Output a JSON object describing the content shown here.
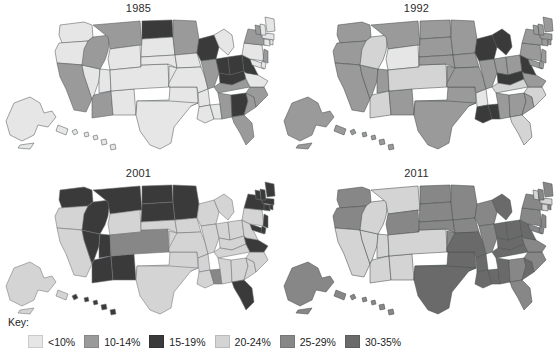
{
  "figure": {
    "title": "",
    "type": "choropleth-map-small-multiples",
    "panel_count": 4
  },
  "panels": [
    {
      "id": "p1985",
      "title": "1985",
      "position": "top-left"
    },
    {
      "id": "p1992",
      "title": "1992",
      "position": "top-right"
    },
    {
      "id": "p2001",
      "title": "2001",
      "position": "bottom-left"
    },
    {
      "id": "p2011",
      "title": "2011",
      "position": "bottom-right"
    }
  ],
  "legend": {
    "label": "Key:",
    "items": [
      {
        "range": "<10%",
        "color": "#e6e6e6"
      },
      {
        "range": "10-14%",
        "color": "#9a9a9a"
      },
      {
        "range": "15-19%",
        "color": "#3a3a3a"
      },
      {
        "range": "20-24%",
        "color": "#d4d4d4"
      },
      {
        "range": "25-29%",
        "color": "#878787"
      },
      {
        "range": "30-35%",
        "color": "#6a6a6a"
      }
    ]
  },
  "chart_data": {
    "type": "heatmap",
    "title": "",
    "subtitle": "",
    "xlabel": "",
    "ylabel": "",
    "legend_position": "bottom-left",
    "grid": false,
    "bins": [
      "<10%",
      "10-14%",
      "15-19%",
      "20-24%",
      "25-29%",
      "30-35%"
    ],
    "bin_colors": [
      "#e6e6e6",
      "#9a9a9a",
      "#3a3a3a",
      "#d4d4d4",
      "#878787",
      "#6a6a6a"
    ],
    "panels": [
      "1985",
      "1992",
      "2001",
      "2011"
    ],
    "series": [
      {
        "name": "1985",
        "values": {
          "WA": "<10%",
          "OR": "<10%",
          "CA": "10-14%",
          "NV": "<10%",
          "ID": "10-14%",
          "MT": "10-14%",
          "WY": "<10%",
          "UT": "<10%",
          "AZ": "10-14%",
          "NM": "<10%",
          "CO": "<10%",
          "ND": "15-19%",
          "SD": "<10%",
          "NE": "<10%",
          "KS": "<10%",
          "OK": "<10%",
          "TX": "<10%",
          "MN": "10-14%",
          "IA": "<10%",
          "MO": "<10%",
          "AR": "<10%",
          "LA": "<10%",
          "WI": "15-19%",
          "IL": "10-14%",
          "MS": "<10%",
          "MI": "<10%",
          "IN": "15-19%",
          "OH": "15-19%",
          "KY": "15-19%",
          "TN": "10-14%",
          "AL": "10-14%",
          "GA": "15-19%",
          "FL": "10-14%",
          "SC": "10-14%",
          "NC": "10-14%",
          "VA": "<10%",
          "WV": "15-19%",
          "MD": "<10%",
          "DE": "<10%",
          "PA": "<10%",
          "NJ": "10-14%",
          "NY": "10-14%",
          "CT": "<10%",
          "RI": "<10%",
          "MA": "<10%",
          "VT": "10-14%",
          "NH": "<10%",
          "ME": "<10%",
          "AK": "<10%",
          "HI": "<10%"
        }
      },
      {
        "name": "1992",
        "values": {
          "WA": "10-14%",
          "OR": "10-14%",
          "CA": "10-14%",
          "NV": "10-14%",
          "ID": "20-24%",
          "MT": "10-14%",
          "WY": "<10%",
          "UT": "10-14%",
          "AZ": "20-24%",
          "NM": "10-14%",
          "CO": "20-24%",
          "ND": "10-14%",
          "SD": "10-14%",
          "NE": "10-14%",
          "KS": "10-14%",
          "OK": "10-14%",
          "TX": "10-14%",
          "MN": "10-14%",
          "IA": "10-14%",
          "MO": "10-14%",
          "AR": "<10%",
          "LA": "15-19%",
          "WI": "15-19%",
          "IL": "10-14%",
          "MS": "15-19%",
          "MI": "15-19%",
          "IN": "10-14%",
          "OH": "10-14%",
          "KY": "15-19%",
          "TN": "20-24%",
          "AL": "10-14%",
          "GA": "10-14%",
          "FL": "20-24%",
          "SC": "10-14%",
          "NC": "20-24%",
          "VA": "10-14%",
          "WV": "15-19%",
          "MD": "10-14%",
          "DE": "10-14%",
          "PA": "10-14%",
          "NJ": "10-14%",
          "NY": "10-14%",
          "CT": "10-14%",
          "RI": "10-14%",
          "MA": "10-14%",
          "VT": "10-14%",
          "NH": "10-14%",
          "ME": "10-14%",
          "AK": "10-14%",
          "HI": "10-14%"
        }
      },
      {
        "name": "2001",
        "values": {
          "WA": "15-19%",
          "OR": "20-24%",
          "CA": "20-24%",
          "NV": "15-19%",
          "ID": "15-19%",
          "MT": "15-19%",
          "WY": "20-24%",
          "UT": "15-19%",
          "AZ": "15-19%",
          "NM": "15-19%",
          "CO": "25-29%",
          "ND": "15-19%",
          "SD": "15-19%",
          "NE": "20-24%",
          "KS": "20-24%",
          "OK": "20-24%",
          "TX": "20-24%",
          "MN": "15-19%",
          "IA": "20-24%",
          "MO": "20-24%",
          "AR": "20-24%",
          "LA": "20-24%",
          "WI": "20-24%",
          "IL": "20-24%",
          "MS": "25-29%",
          "MI": "20-24%",
          "IN": "20-24%",
          "OH": "20-24%",
          "KY": "20-24%",
          "TN": "20-24%",
          "AL": "20-24%",
          "GA": "20-24%",
          "FL": "15-19%",
          "SC": "20-24%",
          "NC": "20-24%",
          "VA": "15-19%",
          "WV": "20-24%",
          "MD": "15-19%",
          "DE": "15-19%",
          "PA": "20-24%",
          "NJ": "15-19%",
          "NY": "15-19%",
          "CT": "15-19%",
          "RI": "15-19%",
          "MA": "15-19%",
          "VT": "15-19%",
          "NH": "15-19%",
          "ME": "15-19%",
          "AK": "20-24%",
          "HI": "15-19%"
        }
      },
      {
        "name": "2011",
        "values": {
          "WA": "25-29%",
          "OR": "25-29%",
          "CA": "20-24%",
          "NV": "20-24%",
          "ID": "20-24%",
          "MT": "20-24%",
          "WY": "25-29%",
          "UT": "20-24%",
          "AZ": "20-24%",
          "NM": "20-24%",
          "CO": "20-24%",
          "ND": "25-29%",
          "SD": "25-29%",
          "NE": "25-29%",
          "KS": "25-29%",
          "OK": "30-35%",
          "TX": "30-35%",
          "MN": "25-29%",
          "IA": "25-29%",
          "MO": "30-35%",
          "AR": "30-35%",
          "LA": "30-35%",
          "WI": "25-29%",
          "IL": "25-29%",
          "MS": "30-35%",
          "MI": "30-35%",
          "IN": "30-35%",
          "OH": "30-35%",
          "KY": "30-35%",
          "TN": "30-35%",
          "AL": "30-35%",
          "GA": "25-29%",
          "FL": "25-29%",
          "SC": "30-35%",
          "NC": "25-29%",
          "VA": "25-29%",
          "WV": "30-35%",
          "MD": "25-29%",
          "DE": "25-29%",
          "PA": "25-29%",
          "NJ": "25-29%",
          "NY": "25-29%",
          "CT": "20-24%",
          "RI": "25-29%",
          "MA": "20-24%",
          "VT": "20-24%",
          "NH": "25-29%",
          "ME": "25-29%",
          "AK": "25-29%",
          "HI": "25-29%"
        }
      }
    ]
  }
}
